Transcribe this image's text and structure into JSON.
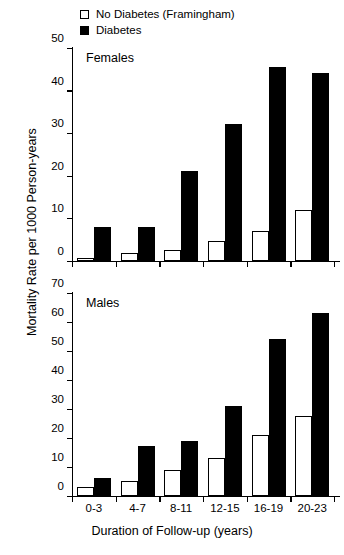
{
  "legend": {
    "items": [
      {
        "label": "No Diabetes (Framingham)",
        "swatch": "open-square-icon"
      },
      {
        "label": "Diabetes",
        "swatch": "filled-square-icon"
      }
    ]
  },
  "axes": {
    "ylabel": "Mortality Rate per 1000 Person-years",
    "xlabel": "Duration of Follow-up (years)"
  },
  "chart_data": [
    {
      "type": "bar",
      "title": "Females",
      "categories": [
        "0-3",
        "4-7",
        "8-11",
        "12-15",
        "16-19",
        "20-23"
      ],
      "series": [
        {
          "name": "No Diabetes (Framingham)",
          "values": [
            0.5,
            1.7,
            2.5,
            4.5,
            7,
            12
          ],
          "color": "#ffffff"
        },
        {
          "name": "Diabetes",
          "values": [
            8,
            8,
            21,
            32,
            45.5,
            44
          ],
          "color": "#000000"
        }
      ],
      "xlabel": "Duration of Follow-up (years)",
      "ylabel": "Mortality Rate per 1000 Person-years",
      "ylim": [
        0,
        50
      ],
      "yticks": [
        0,
        10,
        20,
        30,
        40,
        50
      ],
      "grid": false,
      "legend_position": "top"
    },
    {
      "type": "bar",
      "title": "Males",
      "categories": [
        "0-3",
        "4-7",
        "8-11",
        "12-15",
        "16-19",
        "20-23"
      ],
      "series": [
        {
          "name": "No Diabetes (Framingham)",
          "values": [
            3,
            5,
            9,
            13,
            21,
            27.5
          ],
          "color": "#ffffff"
        },
        {
          "name": "Diabetes",
          "values": [
            6,
            17,
            19,
            31,
            54,
            63
          ],
          "color": "#000000"
        }
      ],
      "xlabel": "Duration of Follow-up (years)",
      "ylabel": "Mortality Rate per 1000 Person-years",
      "ylim": [
        0,
        70
      ],
      "yticks": [
        0,
        10,
        20,
        30,
        40,
        50,
        60,
        70
      ],
      "grid": false,
      "legend_position": "top"
    }
  ]
}
